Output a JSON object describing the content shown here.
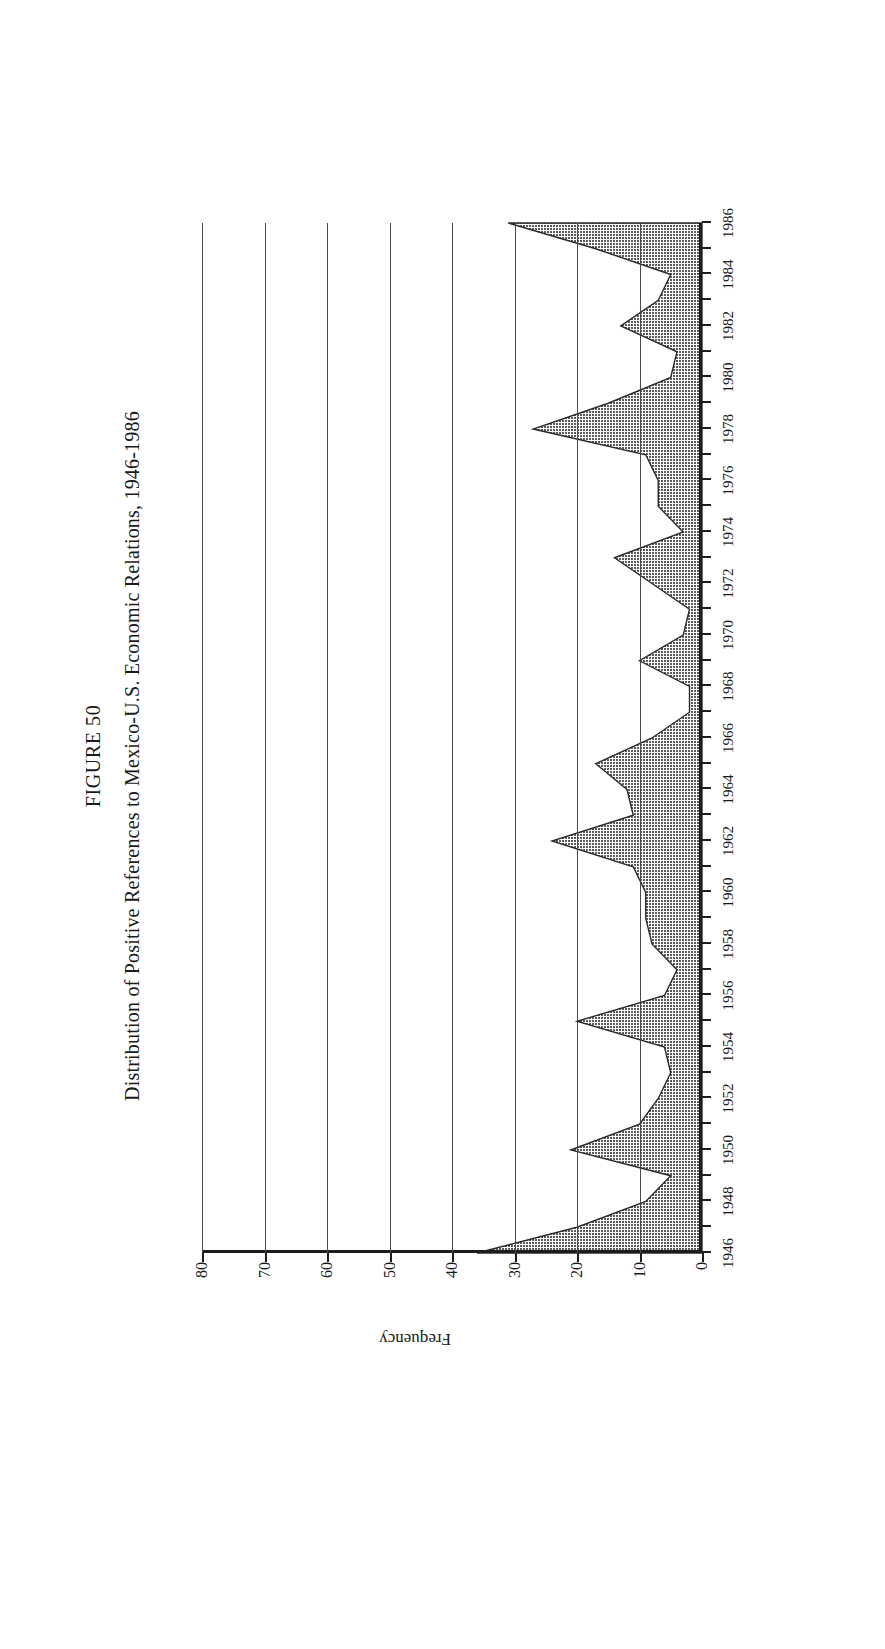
{
  "figure": {
    "number_label": "FIGURE 50",
    "title": "Distribution of Positive References to Mexico-U.S. Economic Relations, 1946-1986"
  },
  "chart_data": {
    "type": "area",
    "title": "Distribution of Positive References to Mexico-U.S. Economic Relations, 1946-1986",
    "xlabel": "",
    "ylabel": "Frequency",
    "ylim": [
      0,
      80
    ],
    "xlim": [
      1946,
      1986
    ],
    "grid": true,
    "legend": "none",
    "ytick_labels": [
      "0",
      "10",
      "20",
      "30",
      "40",
      "50",
      "60",
      "70",
      "80"
    ],
    "ytick_values": [
      0,
      10,
      20,
      30,
      40,
      50,
      60,
      70,
      80
    ],
    "xtick_labels": [
      "1946",
      "1948",
      "1950",
      "1952",
      "1954",
      "1956",
      "1958",
      "1960",
      "1962",
      "1964",
      "1966",
      "1968",
      "1970",
      "1972",
      "1974",
      "1976",
      "1978",
      "1980",
      "1982",
      "1984",
      "1986"
    ],
    "xtick_values": [
      1946,
      1948,
      1950,
      1952,
      1954,
      1956,
      1958,
      1960,
      1962,
      1964,
      1966,
      1968,
      1970,
      1972,
      1974,
      1976,
      1978,
      1980,
      1982,
      1984,
      1986
    ],
    "x": [
      1946,
      1947,
      1948,
      1949,
      1950,
      1951,
      1952,
      1953,
      1954,
      1955,
      1956,
      1957,
      1958,
      1959,
      1960,
      1961,
      1962,
      1963,
      1964,
      1965,
      1966,
      1967,
      1968,
      1969,
      1970,
      1971,
      1972,
      1973,
      1974,
      1975,
      1976,
      1977,
      1978,
      1979,
      1980,
      1981,
      1982,
      1983,
      1984,
      1985,
      1986
    ],
    "values": [
      36,
      20,
      9,
      5,
      21,
      10,
      7,
      5,
      6,
      20,
      6,
      4,
      8,
      9,
      9,
      11,
      24,
      11,
      12,
      17,
      8,
      2,
      2,
      10,
      3,
      2,
      8,
      14,
      3,
      7,
      7,
      9,
      27,
      15,
      5,
      4,
      13,
      7,
      5,
      17,
      31
    ],
    "series": [
      {
        "name": "Positive references",
        "values": [
          36,
          20,
          9,
          5,
          21,
          10,
          7,
          5,
          6,
          20,
          6,
          4,
          8,
          9,
          9,
          11,
          24,
          11,
          12,
          17,
          8,
          2,
          2,
          10,
          3,
          2,
          8,
          14,
          3,
          7,
          7,
          9,
          27,
          15,
          5,
          4,
          13,
          7,
          5,
          17,
          31
        ]
      }
    ]
  },
  "style": {
    "fill_color": "#6e6e6e",
    "line_color": "#2a2a2a",
    "axis_color": "#1d1d1d",
    "grid_color": "#4a4a4a",
    "page_border_color": "#2b2b2b"
  }
}
